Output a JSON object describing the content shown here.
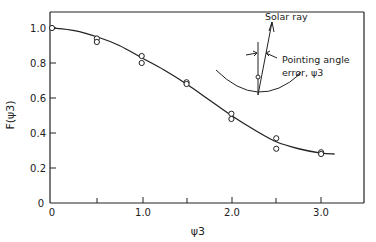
{
  "chart_data": {
    "type": "scatter",
    "title": "",
    "xlabel": "ψ3",
    "ylabel": "F(ψ3)",
    "xlim": [
      0,
      3.5
    ],
    "ylim": [
      0,
      1.1
    ],
    "x_ticks": [
      "0",
      "1.0",
      "2.0",
      "3.0"
    ],
    "x_minor_ticks": [
      0.5,
      1.5,
      2.5
    ],
    "y_ticks": [
      "0",
      "0.2",
      "0.4",
      "0.6",
      "0.8",
      "1.0"
    ],
    "grid": false,
    "legend": null,
    "series": [
      {
        "name": "measured",
        "marker": "open-circle",
        "points": [
          [
            0.0,
            1.0
          ],
          [
            0.5,
            0.94
          ],
          [
            0.5,
            0.92
          ],
          [
            1.0,
            0.84
          ],
          [
            1.0,
            0.8
          ],
          [
            1.5,
            0.69
          ],
          [
            1.5,
            0.68
          ],
          [
            2.0,
            0.51
          ],
          [
            2.0,
            0.48
          ],
          [
            2.5,
            0.37
          ],
          [
            2.5,
            0.31
          ],
          [
            3.0,
            0.29
          ],
          [
            3.0,
            0.28
          ]
        ]
      },
      {
        "name": "fitted curve",
        "style": "solid-line",
        "points": [
          [
            0.0,
            1.0
          ],
          [
            0.25,
            0.985
          ],
          [
            0.5,
            0.95
          ],
          [
            0.75,
            0.9
          ],
          [
            1.0,
            0.83
          ],
          [
            1.25,
            0.76
          ],
          [
            1.5,
            0.68
          ],
          [
            1.75,
            0.59
          ],
          [
            2.0,
            0.5
          ],
          [
            2.25,
            0.42
          ],
          [
            2.5,
            0.35
          ],
          [
            2.75,
            0.31
          ],
          [
            3.0,
            0.285
          ],
          [
            3.15,
            0.28
          ]
        ]
      }
    ],
    "annotations": {
      "solar_ray": "Solar ray",
      "pointing_error_line1": "Pointing angle",
      "pointing_error_line2": "error, ψ3"
    }
  }
}
